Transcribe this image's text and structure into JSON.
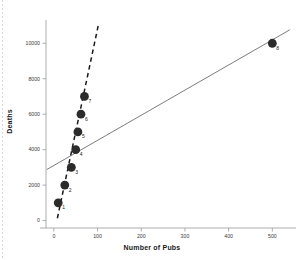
{
  "chart_data": {
    "type": "scatter",
    "title": "",
    "xlabel": "Number of Pubs",
    "ylabel": "Deaths",
    "xlim": [
      -18,
      545
    ],
    "ylim": [
      -420,
      11200
    ],
    "xticks": [
      0,
      100,
      200,
      300,
      400,
      500
    ],
    "xtick_labels": [
      "0",
      "100",
      "200",
      "300",
      "400",
      "500"
    ],
    "yticks": [
      0,
      2000,
      4000,
      6000,
      8000,
      10000
    ],
    "ytick_labels": [
      "0",
      "2000",
      "4000",
      "6000",
      "8000",
      "10000"
    ],
    "grid": false,
    "legend": "none",
    "points": [
      {
        "label": "1",
        "x": 10,
        "y": 1000
      },
      {
        "label": "2",
        "x": 25,
        "y": 2000
      },
      {
        "label": "3",
        "x": 40,
        "y": 3000
      },
      {
        "label": "4",
        "x": 50,
        "y": 4000
      },
      {
        "label": "5",
        "x": 55,
        "y": 5000
      },
      {
        "label": "6",
        "x": 62,
        "y": 6000
      },
      {
        "label": "7",
        "x": 70,
        "y": 7000
      },
      {
        "label": "8",
        "x": 500,
        "y": 10000
      }
    ],
    "lines": [
      {
        "name": "fit-excluding-outlier",
        "style": "dashed",
        "color": "#1a1a1a",
        "x0": 8,
        "y0": 130,
        "x1": 102,
        "y1": 11050
      },
      {
        "name": "fit-all-points",
        "style": "solid",
        "color": "#6e6e6e",
        "x0": -16,
        "y0": 2880,
        "x1": 540,
        "y1": 10760
      }
    ],
    "point_color": "#2b2b2b",
    "point_radius_px": 4.4
  },
  "figure": {
    "axis_color": "#9a9a9a",
    "background": "#ffffff"
  }
}
